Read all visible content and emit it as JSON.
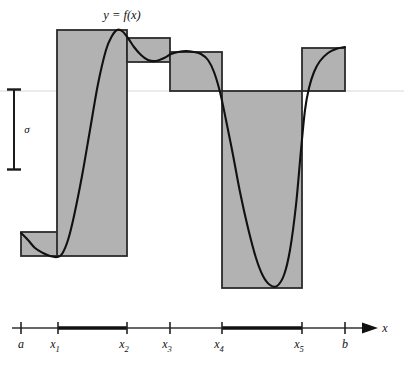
{
  "figure": {
    "curve_label": "y = f(x)",
    "sigma_label": "σ",
    "axis_variable": "x"
  },
  "axis": {
    "labels": [
      {
        "id": "a",
        "text": "a",
        "sub": ""
      },
      {
        "id": "x1",
        "text": "x",
        "sub": "1"
      },
      {
        "id": "x2",
        "text": "x",
        "sub": "2"
      },
      {
        "id": "x3",
        "text": "x",
        "sub": "3"
      },
      {
        "id": "x4",
        "text": "x",
        "sub": "4"
      },
      {
        "id": "x5",
        "text": "x",
        "sub": "5"
      },
      {
        "id": "b",
        "text": "b",
        "sub": ""
      }
    ]
  },
  "colors": {
    "fill": "#b2b2b2",
    "stroke": "#2b2b2b",
    "curve": "#111111",
    "baseline": "#d8d8d8",
    "axis": "#333333",
    "thick_segment": "#111111",
    "background": "#ffffff"
  },
  "chart_data": {
    "type": "bar",
    "title": "y = f(x)",
    "xlabel": "x",
    "ylabel": "",
    "grid": false,
    "legend": null,
    "baseline_y_px": 91,
    "partition": {
      "names": [
        "a",
        "x1",
        "x2",
        "x3",
        "x4",
        "x5",
        "b"
      ],
      "x_px": [
        21,
        58,
        127,
        170,
        222,
        302,
        345
      ]
    },
    "categories": [
      "a-x1",
      "x1-x2",
      "x2-x3",
      "x3-x4",
      "x4-x5",
      "x5-b"
    ],
    "bars_px": [
      {
        "category": "a-x1",
        "x0": 21,
        "x1": 58,
        "top": 232,
        "bottom": 256
      },
      {
        "category": "x1-x2",
        "x0": 57,
        "x1": 127,
        "top": 30,
        "bottom": 256
      },
      {
        "category": "x2-x3",
        "x0": 127,
        "x1": 170,
        "top": 38,
        "bottom": 62
      },
      {
        "category": "x3-x4",
        "x0": 170,
        "x1": 222,
        "top": 52,
        "bottom": 91
      },
      {
        "category": "x4-x5",
        "x0": 222,
        "x1": 302,
        "top": 91,
        "bottom": 288
      },
      {
        "category": "x5-b",
        "x0": 302,
        "x1": 345,
        "top": 48,
        "bottom": 91
      }
    ],
    "values": [
      -141,
      61,
      53,
      39,
      -197,
      43
    ],
    "thick_segments": [
      {
        "from": "x1",
        "to": "x2"
      },
      {
        "from": "x4",
        "to": "x5"
      }
    ],
    "sigma_bar": {
      "x_px": 14,
      "y_top_px": 89,
      "y_bottom_px": 170
    },
    "curve_points_px": [
      [
        21,
        233
      ],
      [
        28,
        240
      ],
      [
        35,
        248
      ],
      [
        43,
        253
      ],
      [
        50,
        256
      ],
      [
        57,
        257
      ],
      [
        62,
        254
      ],
      [
        68,
        240
      ],
      [
        74,
        216
      ],
      [
        82,
        176
      ],
      [
        90,
        130
      ],
      [
        98,
        84
      ],
      [
        106,
        50
      ],
      [
        112,
        36
      ],
      [
        117,
        30
      ],
      [
        122,
        31
      ],
      [
        128,
        38
      ],
      [
        134,
        47
      ],
      [
        141,
        55
      ],
      [
        148,
        60
      ],
      [
        156,
        61
      ],
      [
        164,
        58
      ],
      [
        171,
        54
      ],
      [
        178,
        52
      ],
      [
        186,
        51
      ],
      [
        194,
        52
      ],
      [
        201,
        54
      ],
      [
        208,
        60
      ],
      [
        214,
        72
      ],
      [
        220,
        92
      ],
      [
        226,
        120
      ],
      [
        233,
        155
      ],
      [
        240,
        192
      ],
      [
        248,
        228
      ],
      [
        256,
        258
      ],
      [
        263,
        276
      ],
      [
        270,
        285
      ],
      [
        277,
        286
      ],
      [
        284,
        275
      ],
      [
        290,
        250
      ],
      [
        296,
        205
      ],
      [
        301,
        150
      ],
      [
        305,
        110
      ],
      [
        309,
        88
      ],
      [
        314,
        72
      ],
      [
        320,
        61
      ],
      [
        328,
        53
      ],
      [
        336,
        49
      ],
      [
        345,
        47
      ]
    ]
  }
}
